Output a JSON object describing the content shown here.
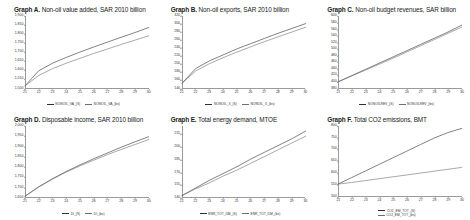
{
  "figure": {
    "background": "#ffffff",
    "series_colors": [
      "#2f2f2f",
      "#6e6e6e"
    ]
  },
  "panels": [
    {
      "label": "Graph A.",
      "description": "Non-oil value added, SAR 2010 billion",
      "legend_layout": "inline"
    },
    {
      "label": "Graph B.",
      "description": "Non-oil exports, SAR 2010 billion",
      "legend_layout": "inline"
    },
    {
      "label": "Graph C.",
      "description": "Non-oil budget revenues, SAR billion",
      "legend_layout": "inline"
    },
    {
      "label": "Graph D.",
      "description": "Disposable income, SAR 2010 billion",
      "legend_layout": "inline"
    },
    {
      "label": "Graph E.",
      "description": "Total energy demand, MTOE",
      "legend_layout": "inline"
    },
    {
      "label": "Graph F.",
      "description": "Total CO2 emissions, BMT",
      "legend_layout": "stacked"
    }
  ],
  "chart_data": [
    {
      "type": "line",
      "title": "Graph A. Non-oil value added, SAR 2010 billion",
      "xlabel": "",
      "ylabel": "",
      "x": [
        21,
        22,
        23,
        24,
        25,
        26,
        27,
        28,
        29,
        30
      ],
      "xticklabels": [
        "21",
        "22",
        "23",
        "24",
        "25",
        "26",
        "27",
        "28",
        "29",
        "30"
      ],
      "xlim": [
        21,
        30
      ],
      "ylim": [
        1500,
        1900
      ],
      "yticks": [
        1500,
        1550,
        1600,
        1650,
        1700,
        1750,
        1800,
        1850,
        1900
      ],
      "yticklabels": [
        "1,500",
        "1,550",
        "1,600",
        "1,650",
        "1,700",
        "1,750",
        "1,800",
        "1,850",
        "1,900"
      ],
      "grid": false,
      "legend_position": "bottom",
      "series": [
        {
          "name": "NONOIL_VA_(S)",
          "values": [
            1512,
            1596,
            1638,
            1670,
            1700,
            1728,
            1755,
            1782,
            1808,
            1836
          ]
        },
        {
          "name": "NONOIL_VA_(bs)",
          "values": [
            1512,
            1570,
            1608,
            1638,
            1665,
            1692,
            1717,
            1742,
            1766,
            1790
          ]
        }
      ]
    },
    {
      "type": "line",
      "title": "Graph B. Non-oil exports, SAR 2010 billion",
      "xlabel": "",
      "ylabel": "",
      "x": [
        21,
        22,
        23,
        24,
        25,
        26,
        27,
        28,
        29,
        30
      ],
      "xticklabels": [
        "21",
        "22",
        "23",
        "24",
        "25",
        "26",
        "27",
        "28",
        "29",
        "30"
      ],
      "xlim": [
        21,
        30
      ],
      "ylim": [
        140,
        320
      ],
      "yticks": [
        140,
        160,
        180,
        200,
        220,
        240,
        260,
        280,
        300,
        320
      ],
      "yticklabels": [
        "140",
        "160",
        "180",
        "200",
        "220",
        "240",
        "260",
        "280",
        "300",
        "320"
      ],
      "grid": false,
      "legend_position": "bottom",
      "series": [
        {
          "name": "NONOIL_X_(S)",
          "values": [
            152,
            189,
            208,
            223,
            238,
            251,
            264,
            277,
            289,
            301
          ]
        },
        {
          "name": "NONOIL_X_(bs)",
          "values": [
            152,
            183,
            201,
            216,
            230,
            243,
            256,
            268,
            280,
            292
          ]
        }
      ]
    },
    {
      "type": "line",
      "title": "Graph C. Non-oil budget revenues, SAR billion",
      "xlabel": "",
      "ylabel": "",
      "x": [
        21,
        22,
        23,
        24,
        25,
        26,
        27,
        28,
        29,
        30
      ],
      "xticklabels": [
        "21",
        "22",
        "23",
        "24",
        "25",
        "26",
        "27",
        "28",
        "29",
        "30"
      ],
      "xlim": [
        21,
        30
      ],
      "ylim": [
        380,
        600
      ],
      "yticks": [
        380,
        400,
        420,
        440,
        460,
        480,
        500,
        520,
        540,
        560,
        580,
        600
      ],
      "yticklabels": [
        "380",
        "400",
        "420",
        "440",
        "460",
        "480",
        "500",
        "520",
        "540",
        "560",
        "580",
        "600"
      ],
      "grid": false,
      "legend_position": "bottom",
      "series": [
        {
          "name": "NONOILREV_(S)",
          "values": [
            399,
            418,
            437,
            456,
            475,
            494,
            513,
            532,
            551,
            572
          ]
        },
        {
          "name": "NONOILREV_(bs)",
          "values": [
            399,
            417,
            435,
            453,
            471,
            490,
            509,
            528,
            547,
            566
          ]
        }
      ]
    },
    {
      "type": "line",
      "title": "Graph D. Disposable income, SAR 2010 billion",
      "xlabel": "",
      "ylabel": "",
      "x": [
        21,
        22,
        23,
        24,
        25,
        26,
        27,
        28,
        29,
        30
      ],
      "xticklabels": [
        "21",
        "22",
        "23",
        "24",
        "25",
        "26",
        "27",
        "28",
        "29",
        "30"
      ],
      "xlim": [
        21,
        30
      ],
      "ylim": [
        1650,
        2000
      ],
      "yticks": [
        1650,
        1700,
        1750,
        1800,
        1850,
        1900,
        1950,
        2000
      ],
      "yticklabels": [
        "1,650",
        "1,700",
        "1,750",
        "1,800",
        "1,850",
        "1,900",
        "1,950",
        "2,000"
      ],
      "grid": false,
      "legend_position": "bottom",
      "series": [
        {
          "name": "DI_(S)",
          "values": [
            1659,
            1705,
            1744,
            1779,
            1811,
            1841,
            1869,
            1897,
            1923,
            1948
          ]
        },
        {
          "name": "DI_(bs)",
          "values": [
            1659,
            1704,
            1742,
            1776,
            1806,
            1834,
            1861,
            1886,
            1910,
            1934
          ]
        }
      ]
    },
    {
      "type": "line",
      "title": "Graph E. Total energy demand, MTOE",
      "xlabel": "",
      "ylabel": "",
      "x": [
        21,
        22,
        23,
        24,
        25,
        26,
        27,
        28,
        29,
        30
      ],
      "xticklabels": [
        "21",
        "22",
        "23",
        "24",
        "25",
        "26",
        "27",
        "28",
        "29",
        "30"
      ],
      "xlim": [
        21,
        30
      ],
      "ylim": [
        140,
        225
      ],
      "yticks": [
        140,
        155,
        170,
        185,
        200,
        215
      ],
      "yticklabels": [
        "140",
        "155",
        "170",
        "185",
        "200",
        "215"
      ],
      "grid": false,
      "legend_position": "bottom",
      "series": [
        {
          "name": "ENR_TOT_DM_(S)",
          "values": [
            143,
            152,
            161,
            169,
            177,
            186,
            194,
            202,
            210,
            219
          ]
        },
        {
          "name": "ENR_TOT_DM_(bs)",
          "values": [
            143,
            151,
            158,
            166,
            173,
            181,
            189,
            197,
            205,
            213
          ]
        }
      ]
    },
    {
      "type": "line",
      "title": "Graph F. Total CO2 emissions, BMT",
      "xlabel": "",
      "ylabel": "",
      "x": [
        21,
        22,
        23,
        24,
        25,
        26,
        27,
        28,
        29,
        30
      ],
      "xticklabels": [
        "21",
        "22",
        "23",
        "24",
        "25",
        "26",
        "27",
        "28",
        "29",
        "30"
      ],
      "xlim": [
        21,
        30
      ],
      "ylim": [
        500,
        800
      ],
      "yticks": [
        500,
        550,
        600,
        650,
        700,
        750,
        800
      ],
      "yticklabels": [
        "500",
        "550",
        "600",
        "650",
        "700",
        "750",
        "800"
      ],
      "grid": false,
      "legend_position": "bottom",
      "series": [
        {
          "name": "CO2_EM_TOT_(S)",
          "values": [
            553,
            581,
            609,
            637,
            665,
            693,
            721,
            749,
            772,
            790
          ]
        },
        {
          "name": "CO2_EM_TOT_(bs)",
          "values": [
            553,
            560,
            568,
            576,
            584,
            592,
            600,
            608,
            616,
            624
          ]
        }
      ]
    }
  ]
}
